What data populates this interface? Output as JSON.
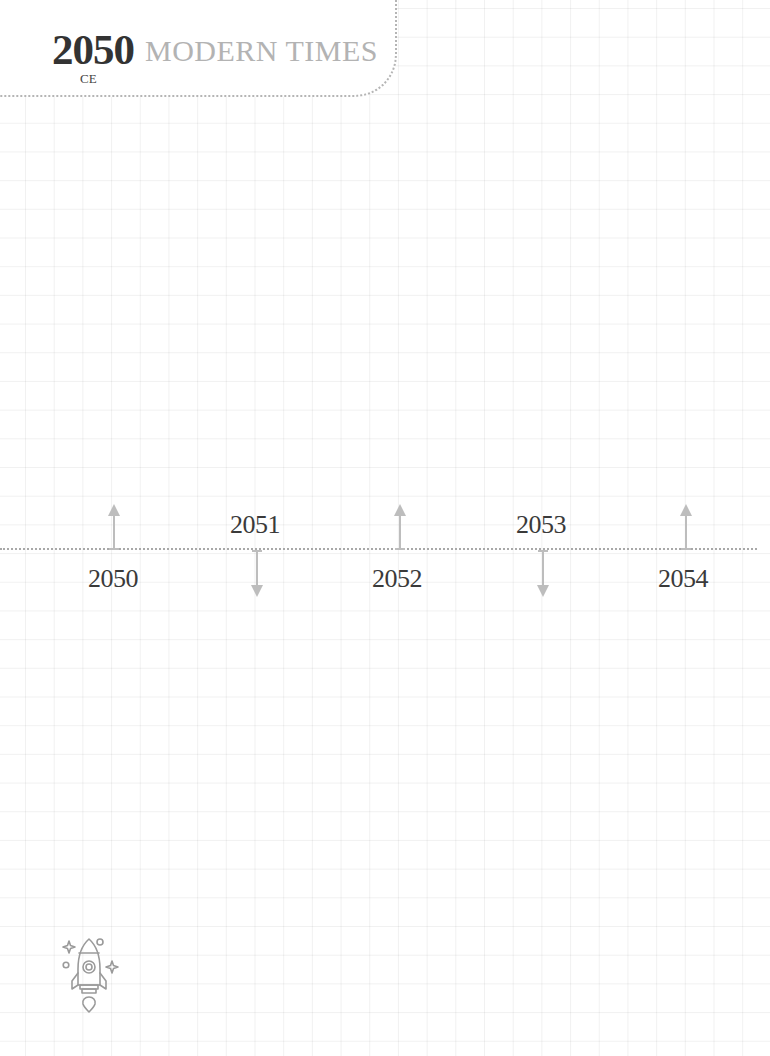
{
  "header": {
    "year": "2050",
    "title": "MODERN TIMES",
    "era_suffix": "CE"
  },
  "timeline": {
    "events": [
      {
        "year": "2050",
        "arrow": "up",
        "label_position": "below"
      },
      {
        "year": "2051",
        "arrow": "down",
        "label_position": "above"
      },
      {
        "year": "2052",
        "arrow": "up",
        "label_position": "below"
      },
      {
        "year": "2053",
        "arrow": "down",
        "label_position": "above"
      },
      {
        "year": "2054",
        "arrow": "up",
        "label_position": "below"
      }
    ]
  },
  "decoration": {
    "icon": "rocket-icon"
  },
  "colors": {
    "year_text": "#333333",
    "title_text": "#b3b3b3",
    "arrow": "#bdbdbd",
    "dotted_line": "#a8a8a8",
    "grid": "#eeeeee",
    "icon_stroke": "#9a9a9a"
  }
}
